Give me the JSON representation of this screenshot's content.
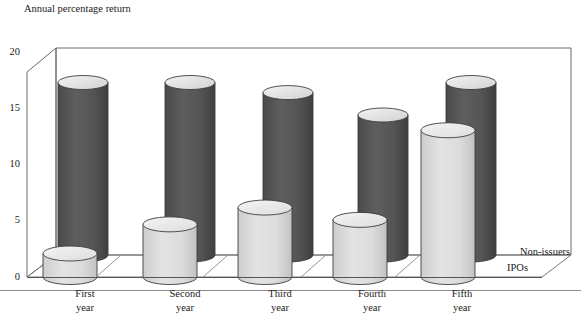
{
  "chart_data": {
    "type": "bar",
    "title": "Annual percentage return",
    "subtitle": "",
    "xlabel": "",
    "ylabel": "Annual percentage return",
    "ylim": [
      0,
      20
    ],
    "yticks": [
      0,
      5,
      10,
      15,
      20
    ],
    "ytick_labels": [
      "0",
      "5",
      "10",
      "15",
      "20"
    ],
    "grid": false,
    "legend_position": "right",
    "projection": "3d-cylinders",
    "categories": [
      "First year",
      "Second year",
      "Third year",
      "Fourth year",
      "Fifth year"
    ],
    "category_lines": [
      [
        "First",
        "year"
      ],
      [
        "Second",
        "year"
      ],
      [
        "Third",
        "year"
      ],
      [
        "Fourth",
        "year"
      ],
      [
        "Fifth",
        "year"
      ]
    ],
    "series": [
      {
        "name": "Non-issuers",
        "row": "back",
        "color": "#565656",
        "values": [
          15.4,
          15.4,
          14.5,
          12.5,
          15.4
        ]
      },
      {
        "name": "IPOs",
        "row": "front",
        "color": "#d9d9d9",
        "values": [
          2.1,
          4.7,
          6.2,
          5.1,
          13.1
        ]
      }
    ]
  },
  "legend": {
    "entries": [
      {
        "label": "Non-issuers"
      },
      {
        "label": "IPOs"
      }
    ]
  },
  "colors": {
    "non_issuers_fill": "#565656",
    "non_issuers_top": "#e8e8e8",
    "ipos_fill": "#d9d9d9",
    "ipos_top": "#ebebeb",
    "outline": "#3d3d3d",
    "frame": "#6b6b6b",
    "text": "#1a1a1a"
  }
}
